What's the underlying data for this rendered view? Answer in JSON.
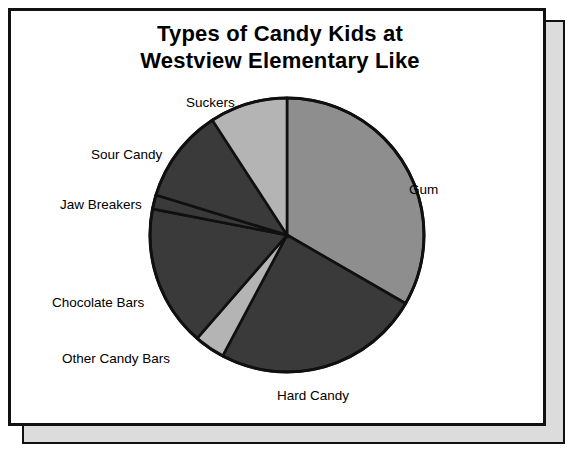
{
  "page": {
    "background_color": "#ffffff",
    "border_color": "#111111",
    "back_sheet_color": "#dcdcdc"
  },
  "title": {
    "line1": "Types of Candy Kids at",
    "line2": "Westview Elementary Like"
  },
  "chart_data": {
    "type": "pie",
    "title": "Types of Candy Kids at Westview Elementary Like",
    "xlabel": "",
    "ylabel": "",
    "legend_position": "none",
    "grid": false,
    "labels_outside": true,
    "start_angle_deg": 0,
    "direction": "clockwise",
    "categories": [
      "Gum",
      "Hard Candy",
      "Other Candy Bars",
      "Chocolate Bars",
      "Jaw Breakers",
      "Sour Candy",
      "Suckers"
    ],
    "values": [
      33.3,
      24.4,
      3.6,
      16.7,
      1.7,
      11.1,
      9.2
    ],
    "slices": [
      {
        "label": "Gum",
        "value": 33.3,
        "start_deg": 0,
        "end_deg": 120,
        "color": "#8e8e8e",
        "label_x": 398,
        "label_y": 172
      },
      {
        "label": "Hard Candy",
        "value": 24.4,
        "start_deg": 120,
        "end_deg": 208,
        "color": "#3a3a3a",
        "label_x": 266,
        "label_y": 378
      },
      {
        "label": "Other Candy Bars",
        "value": 3.6,
        "start_deg": 208,
        "end_deg": 221,
        "color": "#b4b4b4",
        "label_x": 51,
        "label_y": 341
      },
      {
        "label": "Chocolate Bars",
        "value": 16.7,
        "start_deg": 221,
        "end_deg": 281,
        "color": "#3a3a3a",
        "label_x": 41,
        "label_y": 285
      },
      {
        "label": "Jaw Breakers",
        "value": 1.7,
        "start_deg": 281,
        "end_deg": 287,
        "color": "#3a3a3a",
        "label_x": 49,
        "label_y": 187
      },
      {
        "label": "Sour Candy",
        "value": 11.1,
        "start_deg": 287,
        "end_deg": 327,
        "color": "#3a3a3a",
        "label_x": 80,
        "label_y": 137
      },
      {
        "label": "Suckers",
        "value": 9.2,
        "start_deg": 327,
        "end_deg": 360,
        "color": "#b4b4b4",
        "label_x": 175,
        "label_y": 85
      }
    ],
    "geometry": {
      "center_x": 276,
      "center_y": 224,
      "radius": 137
    }
  }
}
